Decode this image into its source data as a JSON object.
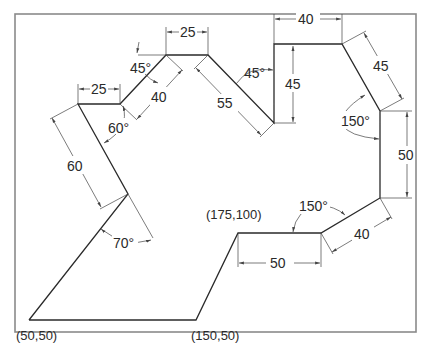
{
  "figure": {
    "type": "engineering-dimension-drawing",
    "frame_color": "#8a8a8a",
    "line_color": "#2a2a2a",
    "background": "#ffffff"
  },
  "coordinates": {
    "p1": "(50,50)",
    "p2": "(150,50)",
    "p3": "(175,100)"
  },
  "linear_dims": {
    "bottom_horizontal": "50",
    "lower_right_diagonal": "40",
    "right_vertical": "50",
    "upper_right_diagonal": "45",
    "top_right_horizontal": "40",
    "center_vertical": "45",
    "center_diagonal": "55",
    "top_horizontal": "25",
    "upper_left_diagonal": "40",
    "left_horizontal": "25",
    "left_diagonal": "60"
  },
  "angle_dims": {
    "lower_right_angle": "150°",
    "upper_right_angle": "150°",
    "center_angle": "45°",
    "upper_left_angle": "45°",
    "left_angle": "60°",
    "bottom_left_angle": "70°"
  }
}
